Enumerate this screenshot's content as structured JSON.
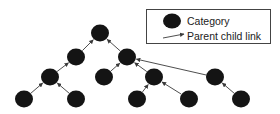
{
  "legend": {
    "category_label": "Category",
    "link_label": "Parent child link"
  },
  "colors": {
    "node": "#141414",
    "edge": "#3a3a3a",
    "legend_border": "#444444",
    "background": "#ffffff"
  },
  "tree": {
    "nodes": [
      {
        "id": "n0",
        "x": 100,
        "y": 33
      },
      {
        "id": "n1",
        "x": 76,
        "y": 57
      },
      {
        "id": "n2",
        "x": 127,
        "y": 57
      },
      {
        "id": "n3",
        "x": 50,
        "y": 77
      },
      {
        "id": "n4",
        "x": 104,
        "y": 77
      },
      {
        "id": "n5",
        "x": 154,
        "y": 77
      },
      {
        "id": "n6",
        "x": 215,
        "y": 77
      },
      {
        "id": "n7",
        "x": 24,
        "y": 99
      },
      {
        "id": "n8",
        "x": 76,
        "y": 99
      },
      {
        "id": "n9",
        "x": 137,
        "y": 99
      },
      {
        "id": "n10",
        "x": 189,
        "y": 99
      },
      {
        "id": "n11",
        "x": 241,
        "y": 99
      }
    ],
    "links": [
      {
        "child": "n1",
        "parent": "n0"
      },
      {
        "child": "n2",
        "parent": "n0"
      },
      {
        "child": "n3",
        "parent": "n1"
      },
      {
        "child": "n4",
        "parent": "n2"
      },
      {
        "child": "n5",
        "parent": "n2"
      },
      {
        "child": "n6",
        "parent": "n2"
      },
      {
        "child": "n7",
        "parent": "n3"
      },
      {
        "child": "n8",
        "parent": "n3"
      },
      {
        "child": "n9",
        "parent": "n5"
      },
      {
        "child": "n10",
        "parent": "n5"
      },
      {
        "child": "n11",
        "parent": "n6"
      }
    ]
  }
}
